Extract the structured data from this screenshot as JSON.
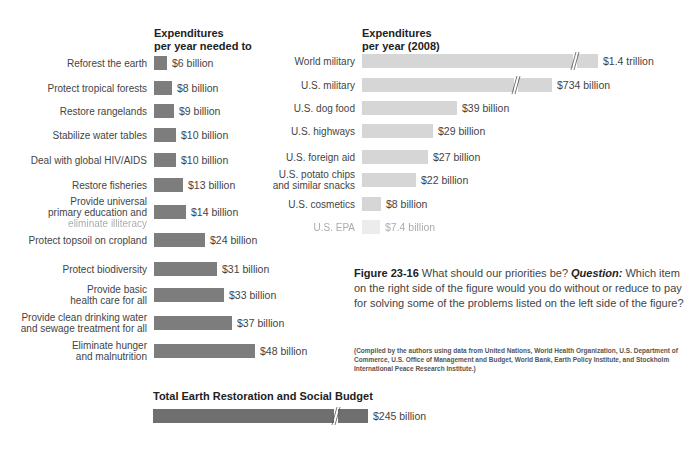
{
  "chart_data": [
    {
      "type": "bar",
      "orientation": "horizontal",
      "title": "Expenditures per year needed to",
      "categories": [
        "Reforest the earth",
        "Protect tropical forests",
        "Restore rangelands",
        "Stabilize water tables",
        "Deal with global HIV/AIDS",
        "Restore fisheries",
        "Provide universal primary education and eliminate illiteracy",
        "Protect topsoil on cropland",
        "Protect biodiversity",
        "Provide basic health care for all",
        "Provide clean drinking water and sewage treatment for all",
        "Eliminate hunger and malnutrition"
      ],
      "values": [
        6,
        8,
        9,
        10,
        10,
        13,
        14,
        24,
        31,
        33,
        37,
        48
      ],
      "unit": "billion USD",
      "value_labels": [
        "$6 billion",
        "$8 billion",
        "$9 billion",
        "$10 billion",
        "$10 billion",
        "$13 billion",
        "$14 billion",
        "$24 billion",
        "$31 billion",
        "$33 billion",
        "$37 billion",
        "$48 billion"
      ],
      "color": "#7d7d7d",
      "grid": false,
      "legend": "none"
    },
    {
      "type": "bar",
      "orientation": "horizontal",
      "title": "Expenditures per year (2008)",
      "categories": [
        "World military",
        "U.S. military",
        "U.S. dog food",
        "U.S. highways",
        "U.S. foreign aid",
        "U.S. potato chips and similar snacks",
        "U.S. cosmetics",
        "U.S. EPA"
      ],
      "values": [
        1400,
        734,
        39,
        29,
        27,
        22,
        8,
        7.4
      ],
      "unit": "billion USD",
      "value_labels": [
        "$1.4 trillion",
        "$734 billion",
        "$39 billion",
        "$29 billion",
        "$27 billion",
        "$22 billion",
        "$8 billion",
        "$7.4 billion"
      ],
      "axis_breaks": [
        "World military",
        "U.S. military"
      ],
      "color": "#d6d6d6",
      "grid": false,
      "legend": "none"
    },
    {
      "type": "bar",
      "orientation": "horizontal",
      "title": "Total Earth Restoration and Social Budget",
      "categories": [
        "Total"
      ],
      "values": [
        245
      ],
      "unit": "billion USD",
      "value_labels": [
        "$245 billion"
      ],
      "axis_breaks": [
        "Total"
      ],
      "color": "#6f6f6f"
    }
  ],
  "left": {
    "header_line1": "Expenditures",
    "header_line2": "per year needed to",
    "rows": [
      {
        "l1": "Reforest the earth",
        "l2": "",
        "l3": "",
        "value": "$6 billion",
        "w": 13
      },
      {
        "l1": "Protect tropical forests",
        "l2": "",
        "l3": "",
        "value": "$8 billion",
        "w": 18
      },
      {
        "l1": "Restore rangelands",
        "l2": "",
        "l3": "",
        "value": "$9 billion",
        "w": 20
      },
      {
        "l1": "Stabilize water tables",
        "l2": "",
        "l3": "",
        "value": "$10 billion",
        "w": 22
      },
      {
        "l1": "Deal with global HIV/AIDS",
        "l2": "",
        "l3": "",
        "value": "$10 billion",
        "w": 22
      },
      {
        "l1": "Restore fisheries",
        "l2": "",
        "l3": "",
        "value": "$13 billion",
        "w": 29
      },
      {
        "l1": "Provide universal",
        "l2": "primary education and",
        "l3": "eliminate illiteracy",
        "value": "$14 billion",
        "w": 32
      },
      {
        "l1": "Protect topsoil on cropland",
        "l2": "",
        "l3": "",
        "value": "$24 billion",
        "w": 51
      },
      {
        "l1": "Protect biodiversity",
        "l2": "",
        "l3": "",
        "value": "$31 billion",
        "w": 63
      },
      {
        "l1": "Provide basic",
        "l2": "health care for all",
        "l3": "",
        "value": "$33 billion",
        "w": 70
      },
      {
        "l1": "Provide clean drinking water",
        "l2": "and sewage treatment for all",
        "l3": "",
        "value": "$37 billion",
        "w": 78
      },
      {
        "l1": "Eliminate hunger",
        "l2": "and malnutrition",
        "l3": "",
        "value": "$48 billion",
        "w": 101
      }
    ]
  },
  "right": {
    "header_line1": "Expenditures",
    "header_line2": "per year (2008)",
    "rows": [
      {
        "l1": "World military",
        "l2": "",
        "value": "$1.4 trillion",
        "w": 236
      },
      {
        "l1": "U.S. military",
        "l2": "",
        "value": "$734 billion",
        "w": 190
      },
      {
        "l1": "U.S. dog food",
        "l2": "",
        "value": "$39 billion",
        "w": 95
      },
      {
        "l1": "U.S. highways",
        "l2": "",
        "value": "$29 billion",
        "w": 71
      },
      {
        "l1": "U.S. foreign aid",
        "l2": "",
        "value": "$27 billion",
        "w": 66
      },
      {
        "l1": "U.S. potato chips",
        "l2": "and similar snacks",
        "value": "$22 billion",
        "w": 54
      },
      {
        "l1": "U.S. cosmetics",
        "l2": "",
        "value": "$8 billion",
        "w": 19
      },
      {
        "l1": "U.S. EPA",
        "l2": "",
        "value": "$7.4 billion",
        "w": 18
      }
    ]
  },
  "total": {
    "title": "Total Earth Restoration and Social Budget",
    "value": "$245 billion"
  },
  "caption": {
    "figure": "Figure 23-16",
    "text1": " What should our priorities be? ",
    "question": "Question:",
    "text2": " Which item on the right side of the figure would you do without or reduce to pay for solving some of the problems listed on the left side of the figure?",
    "source": "(Compiled by the authors using data from United Nations, World Health Organization, U.S. Department of Commerce, U.S. Office of Management and Budget, World Bank, Earth Policy Institute, and Stockholm International Peace Research Institute.)"
  }
}
